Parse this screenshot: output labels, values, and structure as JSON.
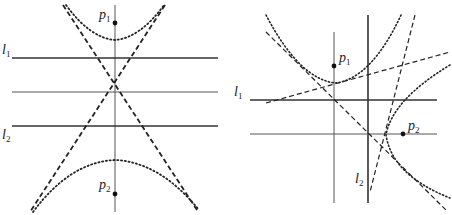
{
  "figure": {
    "panels": [
      {
        "id": "left",
        "labels": {
          "p1": {
            "base": "p",
            "sub": "1"
          },
          "p2": {
            "base": "p",
            "sub": "2"
          },
          "l1": {
            "base": "l",
            "sub": "1"
          },
          "l2": {
            "base": "l",
            "sub": "2"
          }
        },
        "colors": {
          "line": "#333333",
          "dash": "#222222",
          "dot": "#222222"
        }
      },
      {
        "id": "right",
        "labels": {
          "p1": {
            "base": "p",
            "sub": "1"
          },
          "p2": {
            "base": "p",
            "sub": "2"
          },
          "l1": {
            "base": "l",
            "sub": "1"
          },
          "l2": {
            "base": "l",
            "sub": "2"
          }
        },
        "colors": {
          "line": "#333333",
          "dash": "#222222",
          "dot": "#222222"
        }
      }
    ]
  }
}
